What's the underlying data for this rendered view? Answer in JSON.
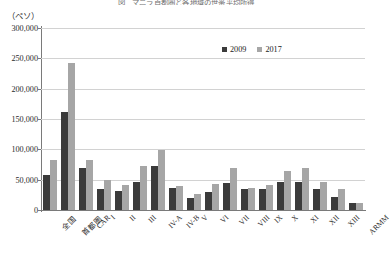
{
  "chart_data": {
    "type": "bar",
    "title": "図　マニラ首都圏と各地域の世帯平均所得",
    "unit_label": "（ペソ）",
    "xlabel": "",
    "ylabel": "",
    "ylim": [
      0,
      300000
    ],
    "ytick_step": 50000,
    "ytick_labels": [
      "300,000",
      "250,000",
      "200,000",
      "150,000",
      "100,000",
      "50,000",
      "0"
    ],
    "ytick_values": [
      300000,
      250000,
      200000,
      150000,
      100000,
      50000,
      0
    ],
    "grid": true,
    "legend_position": "top-right",
    "categories": [
      "全国",
      "首都圏",
      "CAR",
      "I",
      "II",
      "III",
      "IV-A",
      "IV-B",
      "V",
      "VI",
      "VII",
      "VIII",
      "IX",
      "X",
      "XI",
      "XII",
      "XIII",
      "ARMM"
    ],
    "series": [
      {
        "name": "2009",
        "color": "#3b3b3b",
        "values": [
          57000,
          161000,
          70000,
          35000,
          31000,
          46000,
          72000,
          37000,
          19000,
          30000,
          44000,
          35000,
          34000,
          46000,
          46000,
          35000,
          22000,
          12000
        ]
      },
      {
        "name": "2017",
        "color": "#a6a6a6",
        "values": [
          82000,
          243000,
          82000,
          50000,
          41000,
          72000,
          99000,
          40000,
          26000,
          43000,
          70000,
          36000,
          42000,
          64000,
          70000,
          47000,
          35000,
          12000
        ]
      }
    ]
  }
}
